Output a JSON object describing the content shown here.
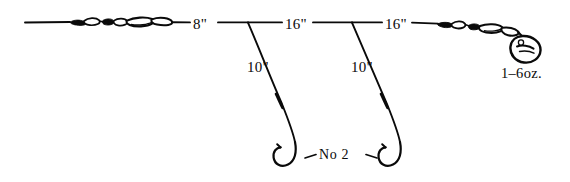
{
  "diagram": {
    "ink_color": "#0a0a0a",
    "background_color": "#ffffff",
    "main_line": {
      "segments": [
        {
          "name": "leader-to-first-dropper",
          "length_label": "8\""
        },
        {
          "name": "first-to-second-dropper",
          "length_label": "16\""
        },
        {
          "name": "second-dropper-to-sinker",
          "length_label": "16\""
        }
      ]
    },
    "droppers": [
      {
        "name": "first-dropper",
        "length_label": "10\""
      },
      {
        "name": "second-dropper",
        "length_label": "10\""
      }
    ],
    "hooks": {
      "count": 2,
      "size_label": "No 2"
    },
    "sinker": {
      "shape": "teardrop-lead-weight",
      "weight_label": "1–6oz."
    },
    "components": {
      "swivel_cluster_left": "swivel-bead-chain",
      "swivel_cluster_right": "swivel-bead-chain"
    }
  },
  "labels": {
    "length_8": "8\"",
    "length_16_first": "16\"",
    "length_16_second": "16\"",
    "length_10_first": "10\"",
    "length_10_second": "10\"",
    "hook_size": "No 2",
    "sinker_weight": "1–6oz."
  }
}
